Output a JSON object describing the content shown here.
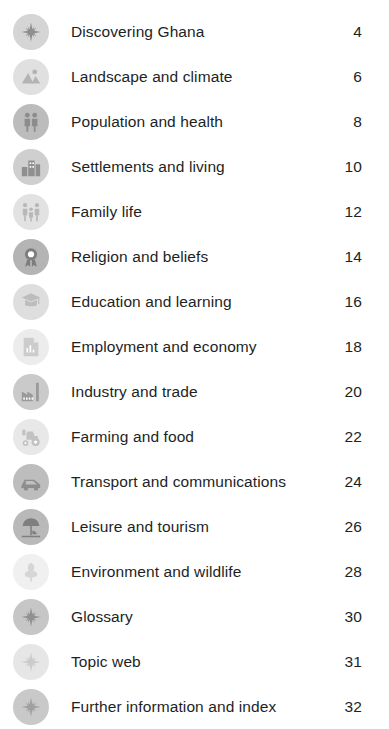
{
  "page": {
    "kind": "table-of-contents",
    "background_color": "#ffffff",
    "text_color": "#221f1f"
  },
  "contents": {
    "entries": [
      {
        "label": "Discovering Ghana",
        "page": "4",
        "icon": "compass-star-icon",
        "circle_color": "#d5d5d5",
        "glyph_color": "#8e8e8e"
      },
      {
        "label": "Landscape and climate",
        "page": "6",
        "icon": "mountain-sun-icon",
        "circle_color": "#e0e0e0",
        "glyph_color": "#b3b3b3"
      },
      {
        "label": "Population and health",
        "page": "8",
        "icon": "two-people-icon",
        "circle_color": "#bcbcbc",
        "glyph_color": "#8c8c8c"
      },
      {
        "label": "Settlements and living",
        "page": "10",
        "icon": "buildings-icon",
        "circle_color": "#cfcfcf",
        "glyph_color": "#8f8f8f"
      },
      {
        "label": "Family life",
        "page": "12",
        "icon": "family-group-icon",
        "circle_color": "#e2e2e2",
        "glyph_color": "#b8b8b8"
      },
      {
        "label": "Religion and beliefs",
        "page": "14",
        "icon": "rosette-emblem-icon",
        "circle_color": "#b4b4b4",
        "glyph_color": "#7d7d7d"
      },
      {
        "label": "Education and learning",
        "page": "16",
        "icon": "graduation-book-icon",
        "circle_color": "#dedede",
        "glyph_color": "#bdbdbd"
      },
      {
        "label": "Employment and economy",
        "page": "18",
        "icon": "document-chart-icon",
        "circle_color": "#ececec",
        "glyph_color": "#cccccc"
      },
      {
        "label": "Industry and trade",
        "page": "20",
        "icon": "factory-icon",
        "circle_color": "#cacaca",
        "glyph_color": "#9a9a9a"
      },
      {
        "label": "Farming and food",
        "page": "22",
        "icon": "tractor-icon",
        "circle_color": "#e8e8e8",
        "glyph_color": "#c2c2c2"
      },
      {
        "label": "Transport and communications",
        "page": "24",
        "icon": "vehicle-icon",
        "circle_color": "#bdbdbd",
        "glyph_color": "#8d8d8d"
      },
      {
        "label": "Leisure and tourism",
        "page": "26",
        "icon": "beach-umbrella-icon",
        "circle_color": "#b9b9b9",
        "glyph_color": "#7f7f7f"
      },
      {
        "label": "Environment and wildlife",
        "page": "28",
        "icon": "tree-icon",
        "circle_color": "#f0f0f0",
        "glyph_color": "#d6d6d6"
      },
      {
        "label": "Glossary",
        "page": "30",
        "icon": "compass-star-icon",
        "circle_color": "#c6c6c6",
        "glyph_color": "#909090"
      },
      {
        "label": "Topic web",
        "page": "31",
        "icon": "compass-star-icon",
        "circle_color": "#e6e6e6",
        "glyph_color": "#cbcbcb"
      },
      {
        "label": "Further information and index",
        "page": "32",
        "icon": "compass-star-icon",
        "circle_color": "#c9c9c9",
        "glyph_color": "#a0a0a0"
      }
    ]
  }
}
